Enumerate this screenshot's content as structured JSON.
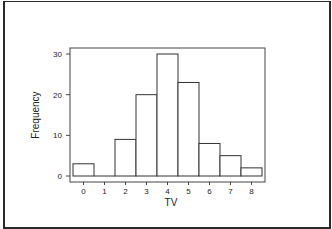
{
  "chart_data": {
    "type": "bar",
    "subtype": "histogram",
    "title": "",
    "xlabel": "TV",
    "ylabel": "Frequency",
    "categories": [
      "0",
      "1",
      "2",
      "3",
      "4",
      "5",
      "6",
      "7",
      "8"
    ],
    "values": [
      3,
      0,
      9,
      20,
      30,
      23,
      8,
      5,
      2
    ],
    "yticks": [
      0,
      10,
      20,
      30
    ],
    "ylim": [
      0,
      31
    ],
    "grid": false,
    "legend": null,
    "bar_fill": "#ffffff",
    "bar_stroke": "#333333"
  }
}
